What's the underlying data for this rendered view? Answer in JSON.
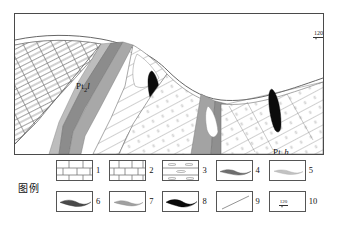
{
  "figure": {
    "type": "geological-cross-section",
    "frame": {
      "border_color": "#4a4a4a",
      "background": "#ffffff"
    }
  },
  "section": {
    "labels": [
      {
        "name": "unit-label-ptl",
        "prefix": "Pt",
        "sub": "2",
        "suffix": "l",
        "text": "Pt2l"
      },
      {
        "name": "unit-label-pth",
        "prefix": "Pt",
        "sub": "2",
        "suffix": "h",
        "text": "Pt2h"
      }
    ],
    "dip_marker": {
      "value": "120",
      "unit": "°",
      "text": "120°"
    },
    "colors": {
      "rock_white": "#ffffff",
      "hatch_line": "#6b6b6b",
      "ore_gray_dark": "#7d7d7d",
      "ore_gray_mid": "#9e9e9e",
      "ore_gray_light": "#bfbfbf",
      "ore_black": "#0a0a0a",
      "outline": "#4a4a4a"
    }
  },
  "legend": {
    "title": "图例",
    "items": [
      {
        "num": "1",
        "icon": "dolomite-brick-pattern",
        "pattern": "brick-tall"
      },
      {
        "num": "2",
        "icon": "limestone-brick-pattern",
        "pattern": "brick-wide"
      },
      {
        "num": "3",
        "icon": "banded-lens-pattern",
        "pattern": "banded-lens"
      },
      {
        "num": "4",
        "icon": "ore-lens-dark-gray",
        "pattern": "lens",
        "fill": "#6e6e6e"
      },
      {
        "num": "5",
        "icon": "ore-lens-light-gray",
        "pattern": "lens",
        "fill": "#c2c2c2"
      },
      {
        "num": "6",
        "icon": "ore-lens-medium-dark",
        "pattern": "lens",
        "fill": "#4a4a4a"
      },
      {
        "num": "7",
        "icon": "ore-lens-medium-gray",
        "pattern": "lens",
        "fill": "#a0a0a0"
      },
      {
        "num": "8",
        "icon": "ore-lens-black",
        "pattern": "lens",
        "fill": "#0a0a0a"
      },
      {
        "num": "9",
        "icon": "fault-line",
        "pattern": "diagonal-line"
      },
      {
        "num": "10",
        "icon": "dip-strike-symbol",
        "pattern": "dip",
        "value": "120"
      }
    ]
  }
}
